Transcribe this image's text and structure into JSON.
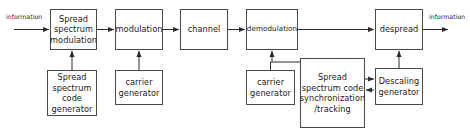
{
  "diagram": {
    "stroke_color": "#4a4a4a",
    "text_color": "#1a1a1a",
    "background_color": "#ffffff",
    "blocks": [
      {
        "id": "spread-spectrum-modulation",
        "label": "Spread\nspectrum\nmodulation",
        "x": 50,
        "y": 9,
        "w": 47,
        "h": 41
      },
      {
        "id": "spread-spectrum-code-generator",
        "label": "Spread\nspectrum\ncode\ngenerator",
        "x": 47,
        "y": 70,
        "w": 50,
        "h": 46
      },
      {
        "id": "modulation",
        "label": "modulation",
        "x": 115,
        "y": 9,
        "w": 48,
        "h": 41
      },
      {
        "id": "carrier-generator-tx",
        "label": "carrier\ngenerator",
        "x": 115,
        "y": 70,
        "w": 48,
        "h": 35
      },
      {
        "id": "channel",
        "label": "channel",
        "x": 180,
        "y": 9,
        "w": 48,
        "h": 41
      },
      {
        "id": "demodulation",
        "label": "demodulation",
        "x": 246,
        "y": 9,
        "w": 52,
        "h": 41
      },
      {
        "id": "carrier-generator-rx",
        "label": "carrier\ngenerator",
        "x": 246,
        "y": 70,
        "w": 49,
        "h": 35
      },
      {
        "id": "spread-spectrum-code-synchronization-tracking",
        "label": "Spread\nspectrum code\nsynchronization\n/tracking",
        "x": 300,
        "y": 58,
        "w": 65,
        "h": 70
      },
      {
        "id": "despread",
        "label": "despread",
        "x": 375,
        "y": 9,
        "w": 48,
        "h": 41
      },
      {
        "id": "descaling-generator",
        "label": "Descaling\ngenerator",
        "x": 375,
        "y": 68,
        "w": 48,
        "h": 37
      }
    ],
    "labels": [
      {
        "id": "information-input",
        "text": "information",
        "x": 6,
        "y": 13
      },
      {
        "id": "information-output",
        "text": "information",
        "x": 429,
        "y": 13
      }
    ]
  }
}
